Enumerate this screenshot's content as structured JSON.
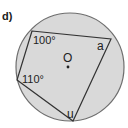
{
  "part_label": "d)",
  "circle": {
    "cx": 70,
    "cy": 67,
    "r": 54,
    "fill": "#d9d9d9",
    "stroke": "#6e6e6e",
    "center_label": "O"
  },
  "quadrilateral": {
    "vertices": [
      {
        "name": "top-left",
        "x": 32,
        "y": 31
      },
      {
        "name": "right",
        "x": 111,
        "y": 39
      },
      {
        "name": "bottom",
        "x": 73,
        "y": 121
      },
      {
        "name": "left",
        "x": 17,
        "y": 80
      }
    ],
    "stroke": "#333333"
  },
  "angles": {
    "top_left": "100°",
    "left": "110°",
    "right": "a",
    "bottom": "u"
  }
}
